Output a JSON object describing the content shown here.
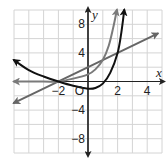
{
  "chart_data": {
    "type": "line",
    "title": "",
    "xlabel": "x",
    "ylabel": "y",
    "origin_label": "O",
    "xlim": [
      -5,
      5
    ],
    "ylim": [
      -10,
      10
    ],
    "grid": true,
    "x_grid_step": 1,
    "y_grid_step": 2,
    "x_tick_labels": [
      {
        "value": -2,
        "label": "−2"
      },
      {
        "value": 2,
        "label": "2"
      },
      {
        "value": 4,
        "label": "4"
      }
    ],
    "y_tick_labels": [
      {
        "value": 8,
        "label": "8"
      },
      {
        "value": 4,
        "label": "4"
      },
      {
        "value": -4,
        "label": "−4"
      },
      {
        "value": -8,
        "label": "−8"
      }
    ],
    "series": [
      {
        "name": "black-curve",
        "color": "#111111",
        "width": 2,
        "arrows": "both",
        "points": [
          [
            -5,
            3
          ],
          [
            -4,
            1.6
          ],
          [
            -3,
            0.7
          ],
          [
            -2,
            0
          ],
          [
            -1,
            -0.6
          ],
          [
            0,
            -1
          ],
          [
            0.5,
            -0.9
          ],
          [
            1,
            -0.3
          ],
          [
            1.5,
            1.2
          ],
          [
            2,
            4
          ],
          [
            2.25,
            6.8
          ],
          [
            2.45,
            10
          ]
        ]
      },
      {
        "name": "gray-curve",
        "color": "#7a7a7a",
        "width": 2,
        "arrows": "both",
        "points": [
          [
            -5,
            0
          ],
          [
            -3,
            0
          ],
          [
            -2,
            0
          ],
          [
            -1,
            0.4
          ],
          [
            0,
            1
          ],
          [
            0.5,
            1.7
          ],
          [
            1,
            3
          ],
          [
            1.4,
            5
          ],
          [
            1.7,
            7.5
          ],
          [
            1.95,
            10
          ]
        ]
      },
      {
        "name": "gray-line",
        "color": "#666666",
        "width": 2,
        "arrows": "both",
        "points": [
          [
            -5,
            -3
          ],
          [
            4.7,
            6.7
          ]
        ]
      }
    ]
  }
}
